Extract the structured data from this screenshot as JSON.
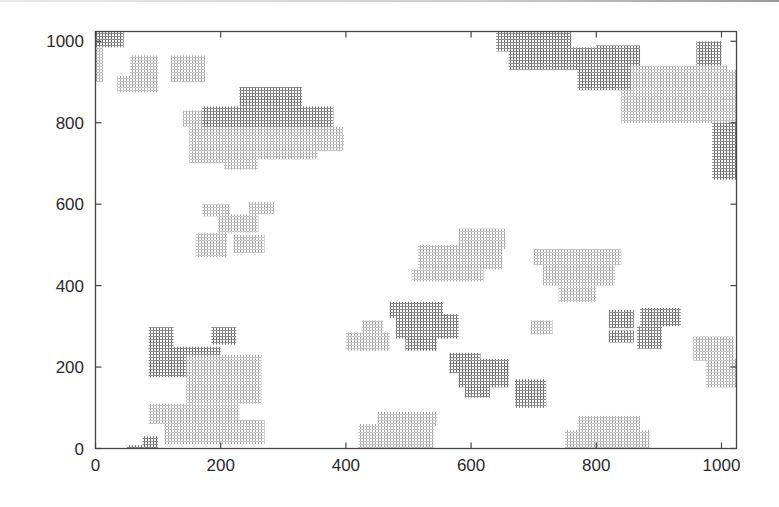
{
  "chart_data": {
    "type": "scatter",
    "title": "",
    "xlabel": "",
    "ylabel": "",
    "xlim": [
      0,
      1024
    ],
    "ylim": [
      0,
      1024
    ],
    "grid": false,
    "legend": null,
    "x_ticks": [
      0,
      200,
      400,
      600,
      800,
      1000
    ],
    "y_ticks": [
      0,
      200,
      400,
      600,
      800,
      1000
    ],
    "x_tick_labels": [
      "0",
      "200",
      "400",
      "600",
      "800",
      "1000"
    ],
    "y_tick_labels": [
      "0",
      "200",
      "400",
      "600",
      "800",
      "1000"
    ],
    "shades": {
      "dark": "#8a8a8a",
      "light": "#bdbdbd"
    },
    "clusters": [
      {
        "shade": "dark",
        "x0": 0,
        "x1": 45,
        "y0": 985,
        "y1": 1024
      },
      {
        "shade": "light",
        "x0": 0,
        "x1": 12,
        "y0": 900,
        "y1": 985
      },
      {
        "shade": "light",
        "x0": 55,
        "x1": 100,
        "y0": 915,
        "y1": 965
      },
      {
        "shade": "light",
        "x0": 35,
        "x1": 100,
        "y0": 875,
        "y1": 915
      },
      {
        "shade": "light",
        "x0": 120,
        "x1": 175,
        "y0": 900,
        "y1": 965
      },
      {
        "shade": "light",
        "x0": 140,
        "x1": 200,
        "y0": 790,
        "y1": 830
      },
      {
        "shade": "dark",
        "x0": 230,
        "x1": 330,
        "y0": 840,
        "y1": 888
      },
      {
        "shade": "dark",
        "x0": 170,
        "x1": 380,
        "y0": 780,
        "y1": 840
      },
      {
        "shade": "light",
        "x0": 150,
        "x1": 395,
        "y0": 730,
        "y1": 790
      },
      {
        "shade": "light",
        "x0": 150,
        "x1": 215,
        "y0": 700,
        "y1": 730
      },
      {
        "shade": "light",
        "x0": 205,
        "x1": 260,
        "y0": 685,
        "y1": 730
      },
      {
        "shade": "light",
        "x0": 260,
        "x1": 355,
        "y0": 710,
        "y1": 730
      },
      {
        "shade": "light",
        "x0": 350,
        "x1": 397,
        "y0": 745,
        "y1": 770
      },
      {
        "shade": "light",
        "x0": 170,
        "x1": 215,
        "y0": 570,
        "y1": 600
      },
      {
        "shade": "light",
        "x0": 245,
        "x1": 285,
        "y0": 575,
        "y1": 605
      },
      {
        "shade": "light",
        "x0": 195,
        "x1": 260,
        "y0": 530,
        "y1": 575
      },
      {
        "shade": "light",
        "x0": 160,
        "x1": 210,
        "y0": 470,
        "y1": 530
      },
      {
        "shade": "light",
        "x0": 220,
        "x1": 270,
        "y0": 480,
        "y1": 525
      },
      {
        "shade": "dark",
        "x0": 85,
        "x1": 125,
        "y0": 245,
        "y1": 298
      },
      {
        "shade": "dark",
        "x0": 185,
        "x1": 225,
        "y0": 255,
        "y1": 298
      },
      {
        "shade": "dark",
        "x0": 85,
        "x1": 200,
        "y0": 175,
        "y1": 250
      },
      {
        "shade": "light",
        "x0": 145,
        "x1": 265,
        "y0": 110,
        "y1": 230
      },
      {
        "shade": "light",
        "x0": 85,
        "x1": 230,
        "y0": 60,
        "y1": 110
      },
      {
        "shade": "light",
        "x0": 110,
        "x1": 270,
        "y0": 10,
        "y1": 70
      },
      {
        "shade": "dark",
        "x0": 75,
        "x1": 100,
        "y0": 0,
        "y1": 30
      },
      {
        "shade": "dark",
        "x0": 50,
        "x1": 90,
        "y0": 0,
        "y1": 8
      },
      {
        "shade": "light",
        "x0": 425,
        "x1": 460,
        "y0": 280,
        "y1": 315
      },
      {
        "shade": "light",
        "x0": 400,
        "x1": 470,
        "y0": 240,
        "y1": 285
      },
      {
        "shade": "dark",
        "x0": 470,
        "x1": 555,
        "y0": 320,
        "y1": 360
      },
      {
        "shade": "dark",
        "x0": 480,
        "x1": 580,
        "y0": 270,
        "y1": 330
      },
      {
        "shade": "dark",
        "x0": 495,
        "x1": 545,
        "y0": 240,
        "y1": 275
      },
      {
        "shade": "dark",
        "x0": 565,
        "x1": 615,
        "y0": 185,
        "y1": 235
      },
      {
        "shade": "dark",
        "x0": 580,
        "x1": 660,
        "y0": 150,
        "y1": 220
      },
      {
        "shade": "dark",
        "x0": 590,
        "x1": 630,
        "y0": 125,
        "y1": 155
      },
      {
        "shade": "dark",
        "x0": 670,
        "x1": 720,
        "y0": 100,
        "y1": 170
      },
      {
        "shade": "light",
        "x0": 580,
        "x1": 655,
        "y0": 490,
        "y1": 540
      },
      {
        "shade": "light",
        "x0": 515,
        "x1": 650,
        "y0": 440,
        "y1": 500
      },
      {
        "shade": "light",
        "x0": 505,
        "x1": 620,
        "y0": 410,
        "y1": 440
      },
      {
        "shade": "light",
        "x0": 450,
        "x1": 545,
        "y0": 55,
        "y1": 90
      },
      {
        "shade": "light",
        "x0": 420,
        "x1": 540,
        "y0": 0,
        "y1": 60
      },
      {
        "shade": "light",
        "x0": 700,
        "x1": 840,
        "y0": 450,
        "y1": 490
      },
      {
        "shade": "light",
        "x0": 715,
        "x1": 830,
        "y0": 400,
        "y1": 450
      },
      {
        "shade": "light",
        "x0": 740,
        "x1": 800,
        "y0": 360,
        "y1": 400
      },
      {
        "shade": "light",
        "x0": 695,
        "x1": 730,
        "y0": 280,
        "y1": 315
      },
      {
        "shade": "dark",
        "x0": 820,
        "x1": 860,
        "y0": 295,
        "y1": 340
      },
      {
        "shade": "dark",
        "x0": 870,
        "x1": 935,
        "y0": 300,
        "y1": 345
      },
      {
        "shade": "dark",
        "x0": 820,
        "x1": 860,
        "y0": 260,
        "y1": 290
      },
      {
        "shade": "dark",
        "x0": 865,
        "x1": 905,
        "y0": 245,
        "y1": 300
      },
      {
        "shade": "light",
        "x0": 955,
        "x1": 1020,
        "y0": 215,
        "y1": 275
      },
      {
        "shade": "light",
        "x0": 975,
        "x1": 1024,
        "y0": 150,
        "y1": 220
      },
      {
        "shade": "light",
        "x0": 770,
        "x1": 870,
        "y0": 40,
        "y1": 80
      },
      {
        "shade": "light",
        "x0": 750,
        "x1": 885,
        "y0": 0,
        "y1": 45
      },
      {
        "shade": "dark",
        "x0": 640,
        "x1": 760,
        "y0": 975,
        "y1": 1024
      },
      {
        "shade": "dark",
        "x0": 660,
        "x1": 800,
        "y0": 930,
        "y1": 985
      },
      {
        "shade": "dark",
        "x0": 770,
        "x1": 860,
        "y0": 880,
        "y1": 960
      },
      {
        "shade": "dark",
        "x0": 800,
        "x1": 870,
        "y0": 910,
        "y1": 990
      },
      {
        "shade": "dark",
        "x0": 960,
        "x1": 1000,
        "y0": 940,
        "y1": 1000
      },
      {
        "shade": "light",
        "x0": 855,
        "x1": 1010,
        "y0": 880,
        "y1": 940
      },
      {
        "shade": "light",
        "x0": 840,
        "x1": 1000,
        "y0": 800,
        "y1": 880
      },
      {
        "shade": "light",
        "x0": 900,
        "x1": 1024,
        "y0": 850,
        "y1": 930
      },
      {
        "shade": "light",
        "x0": 990,
        "x1": 1024,
        "y0": 800,
        "y1": 850
      },
      {
        "shade": "dark",
        "x0": 985,
        "x1": 1024,
        "y0": 660,
        "y1": 800
      }
    ]
  }
}
